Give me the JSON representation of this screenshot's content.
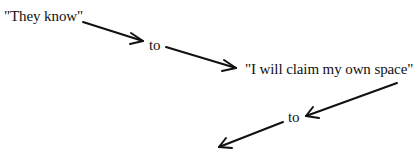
{
  "diagram": {
    "type": "flow",
    "nodes": [
      {
        "id": "start",
        "text": "\"They know\""
      },
      {
        "id": "to1",
        "text": "to"
      },
      {
        "id": "claim",
        "text": "\"I will claim my own space\""
      },
      {
        "id": "to2",
        "text": "to"
      }
    ],
    "edges": [
      {
        "from": "start",
        "to": "to1"
      },
      {
        "from": "to1",
        "to": "claim"
      },
      {
        "from": "claim",
        "to": "to2"
      },
      {
        "from": "to2",
        "to": "(unlabeled)"
      }
    ],
    "colors": {
      "background": "#ffffff",
      "ink": "#111111"
    }
  }
}
